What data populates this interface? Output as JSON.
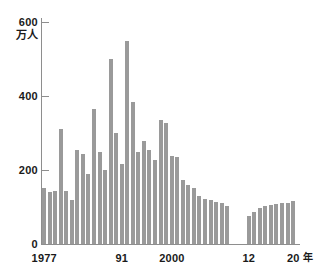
{
  "chart_data": {
    "type": "bar",
    "title": "",
    "subtitle": "",
    "xlabel": "年",
    "ylabel": "万人",
    "ylim": [
      0,
      600
    ],
    "yticks": [
      0,
      200,
      400,
      600
    ],
    "ytick_labels": [
      "0",
      "200",
      "400",
      "600"
    ],
    "grid": false,
    "legend": null,
    "bar_color": "#9a9a9a",
    "axis_color": "#8e8e8e",
    "text_color": "#1a1a1a",
    "background": "#ffffff",
    "xtick_labels": [
      "1977",
      "91",
      "2000",
      "12",
      "20"
    ],
    "note": "Gap in series between 2010 and 2012 (no bars for 2011).",
    "categories": [
      "1977",
      "1978",
      "1979",
      "1980",
      "1981",
      "1982",
      "1983",
      "1984",
      "1985",
      "1986",
      "1987",
      "1988",
      "1989",
      "1990",
      "1991",
      "1992",
      "1993",
      "1994",
      "1995",
      "1996",
      "1997",
      "1998",
      "1999",
      "2000",
      "2001",
      "2002",
      "2003",
      "2004",
      "2005",
      "2006",
      "2007",
      "2008",
      "2009",
      "2010",
      "2012",
      "2013",
      "2014",
      "2015",
      "2016",
      "2017",
      "2018",
      "2019",
      "2020"
    ],
    "values": [
      152,
      140,
      143,
      310,
      143,
      120,
      253,
      243,
      190,
      366,
      249,
      200,
      500,
      299,
      215,
      549,
      385,
      249,
      278,
      255,
      228,
      336,
      328,
      239,
      236,
      174,
      160,
      152,
      130,
      122,
      118,
      113,
      110,
      104,
      76,
      86,
      97,
      103,
      105,
      108,
      112,
      110,
      117
    ]
  },
  "axis": {
    "y_unit": "万人",
    "x_unit": "年"
  }
}
